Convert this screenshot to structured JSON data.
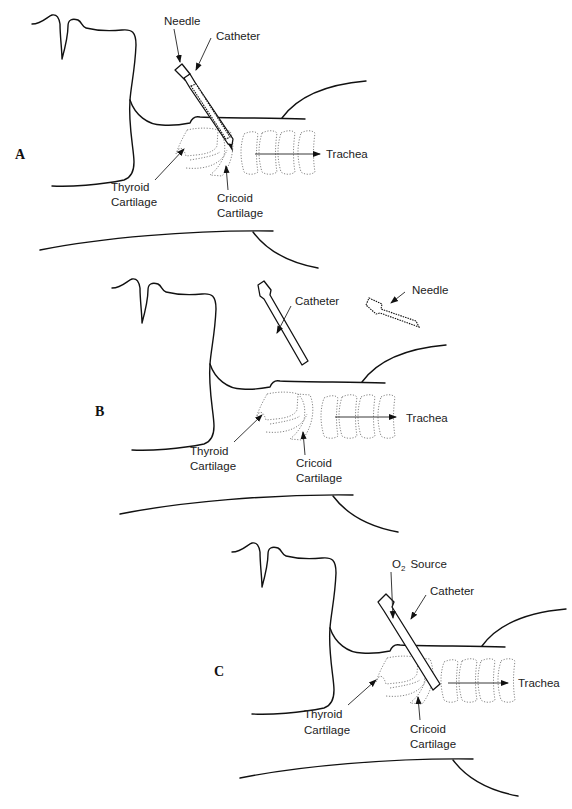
{
  "figure": {
    "panels": [
      {
        "letter": "A",
        "labels": {
          "needle": "Needle",
          "catheter": "Catheter",
          "trachea": "Trachea",
          "thyroid_1": "Thyroid",
          "thyroid_2": "Cartilage",
          "cricoid_1": "Cricoid",
          "cricoid_2": "Cartilage"
        }
      },
      {
        "letter": "B",
        "labels": {
          "needle": "Needle",
          "catheter": "Catheter",
          "trachea": "Trachea",
          "thyroid_1": "Thyroid",
          "thyroid_2": "Cartilage",
          "cricoid_1": "Cricoid",
          "cricoid_2": "Cartilage"
        }
      },
      {
        "letter": "C",
        "labels": {
          "o2_main": "O",
          "o2_sub": "2",
          "o2_rest": "Source",
          "catheter": "Catheter",
          "trachea": "Trachea",
          "thyroid_1": "Thyroid",
          "thyroid_2": "Cartilage",
          "cricoid_1": "Cricoid",
          "cricoid_2": "Cartilage"
        }
      }
    ]
  }
}
